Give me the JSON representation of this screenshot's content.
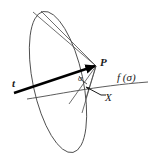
{
  "figure": {
    "kind": "geometric-diagram",
    "background_color": "#ffffff",
    "stroke_color": "#3a3a3a",
    "bold_stroke_color": "#000000",
    "labels": {
      "point_p": "P",
      "tangent_t": "t",
      "angle_alpha": "α",
      "vector_x": "X",
      "curve_f_sigma": "f (σ)"
    },
    "elements": [
      {
        "name": "ellipse",
        "kind": "tilted-ellipse"
      },
      {
        "name": "cone-edge-upper",
        "kind": "line"
      },
      {
        "name": "cone-edge-lower",
        "kind": "line"
      },
      {
        "name": "tangent-arrow",
        "kind": "thick-arrow"
      },
      {
        "name": "angle-arc",
        "kind": "arc"
      },
      {
        "name": "curve-f-sigma",
        "kind": "curve"
      },
      {
        "name": "x-leader-arrow",
        "kind": "leader-arrow"
      }
    ]
  }
}
